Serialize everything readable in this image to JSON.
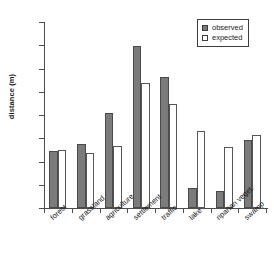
{
  "chart_data": {
    "type": "bar",
    "title": "",
    "subtitle": "",
    "xlabel": "",
    "ylabel": "distance (m)",
    "ylim": [
      0,
      4000
    ],
    "ytick_interval": 500,
    "yticks": [
      0,
      500,
      1000,
      1500,
      2000,
      2500,
      3000,
      3500,
      4000
    ],
    "ytick_labels": [
      "0",
      "500",
      "1000",
      "1500",
      "2000",
      "2500",
      "3000",
      "3500",
      "4000"
    ],
    "grid": false,
    "legend_position": "top-right",
    "categories": [
      "forest",
      "grassland",
      "agriculture",
      "settlement",
      "traffic",
      "lake",
      "riparian veget.",
      "swamp"
    ],
    "series": [
      {
        "name": "observed",
        "color": "#7b7b7b",
        "values": [
          1230,
          1380,
          2050,
          3490,
          2820,
          440,
          370,
          1470
        ]
      },
      {
        "name": "expected",
        "color": "#ffffff",
        "values": [
          1250,
          1190,
          1330,
          2680,
          2230,
          1650,
          1310,
          1580
        ]
      }
    ]
  },
  "legend": {
    "entries": [
      {
        "label": "observed"
      },
      {
        "label": "expected"
      }
    ]
  },
  "axis": {
    "y_title": "distance (m)"
  },
  "colors": {
    "observed_fill": "#7b7b7b",
    "expected_fill": "#ffffff",
    "axis": "#4d4d4d",
    "text": "#1a1a1a",
    "background": "#ffffff"
  }
}
